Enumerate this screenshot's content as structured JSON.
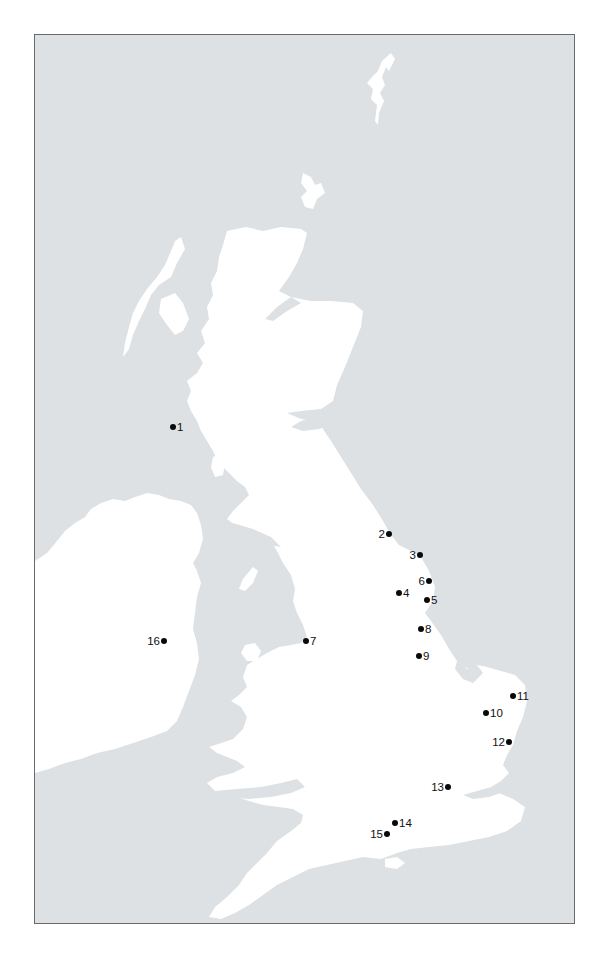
{
  "map": {
    "colors": {
      "sea": "#dde1e3",
      "land": "#ffffff",
      "frame": "#6a6a6a",
      "marker": "#0a0a0a"
    },
    "markers": [
      {
        "id": "1",
        "label": "1",
        "x": 173,
        "y": 427,
        "side": "right"
      },
      {
        "id": "2",
        "label": "2",
        "x": 389,
        "y": 534,
        "side": "left"
      },
      {
        "id": "3",
        "label": "3",
        "x": 420,
        "y": 555,
        "side": "left"
      },
      {
        "id": "4",
        "label": "4",
        "x": 399,
        "y": 593,
        "side": "right"
      },
      {
        "id": "5",
        "label": "5",
        "x": 427,
        "y": 600,
        "side": "right"
      },
      {
        "id": "6",
        "label": "6",
        "x": 429,
        "y": 581,
        "side": "left"
      },
      {
        "id": "7",
        "label": "7",
        "x": 306,
        "y": 641,
        "side": "right"
      },
      {
        "id": "8",
        "label": "8",
        "x": 421,
        "y": 629,
        "side": "right"
      },
      {
        "id": "9",
        "label": "9",
        "x": 419,
        "y": 656,
        "side": "right"
      },
      {
        "id": "10",
        "label": "10",
        "x": 486,
        "y": 713,
        "side": "right"
      },
      {
        "id": "11",
        "label": "11",
        "x": 513,
        "y": 696,
        "side": "right"
      },
      {
        "id": "12",
        "label": "12",
        "x": 509,
        "y": 742,
        "side": "left"
      },
      {
        "id": "13",
        "label": "13",
        "x": 448,
        "y": 787,
        "side": "left"
      },
      {
        "id": "14",
        "label": "14",
        "x": 395,
        "y": 823,
        "side": "right"
      },
      {
        "id": "15",
        "label": "15",
        "x": 387,
        "y": 834,
        "side": "left"
      },
      {
        "id": "16",
        "label": "16",
        "x": 164,
        "y": 641,
        "side": "left"
      }
    ]
  }
}
